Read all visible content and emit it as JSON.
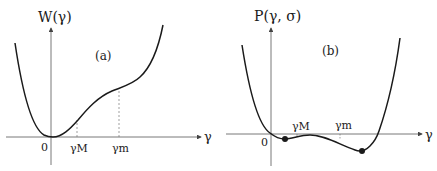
{
  "panel_a": {
    "y_label": "W(γ)",
    "x_label": "γ",
    "tag": "(a)",
    "origin_label": "0",
    "ticks": [
      {
        "label": "γM",
        "x": 77
      },
      {
        "label": "γm",
        "x": 119
      }
    ]
  },
  "panel_b": {
    "y_label": "P(γ, σ)",
    "x_label": "γ",
    "tag": "(b)",
    "origin_label": "0",
    "ticks": [
      {
        "label": "γM",
        "x": 297
      },
      {
        "label": "γm",
        "x": 340
      }
    ],
    "marked_points": [
      {
        "x": 285,
        "y": 139
      },
      {
        "x": 362,
        "y": 151
      }
    ]
  },
  "colors": {
    "curve": "#1a1a1a",
    "axis": "#555555",
    "dash": "#777777"
  }
}
